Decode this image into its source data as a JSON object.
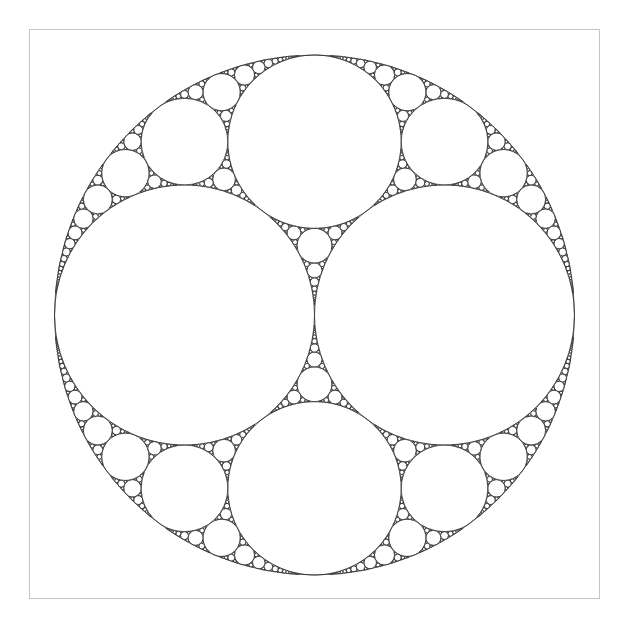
{
  "diagram": {
    "type": "apollonian-gasket",
    "canvas": {
      "width": 625,
      "height": 630
    },
    "frame": {
      "x": 29,
      "y": 29,
      "width": 571,
      "height": 570,
      "stroke": "#c4c4c4"
    },
    "outer_circle": {
      "cx": 314.5,
      "cy": 315,
      "r": 260
    },
    "initial_circles": [
      {
        "name": "left-large",
        "r_fraction": 0.5,
        "dx_fraction": -0.5,
        "dy_fraction": 0
      },
      {
        "name": "right-large",
        "r_fraction": 0.5,
        "dx_fraction": 0.5,
        "dy_fraction": 0
      },
      {
        "name": "top-medium",
        "r_fraction": 0.333333,
        "dx_fraction": 0,
        "dy_fraction": -0.666667
      },
      {
        "name": "bottom-medium",
        "r_fraction": 0.333333,
        "dx_fraction": 0,
        "dy_fraction": 0.666667
      }
    ],
    "min_radius": 0.45,
    "stroke": "#333333",
    "stroke_width": 0.8,
    "background": "#ffffff"
  }
}
